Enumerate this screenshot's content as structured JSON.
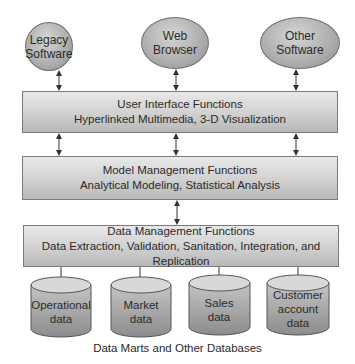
{
  "diagram": {
    "type": "layered-architecture",
    "external_systems": [
      {
        "line1": "Legacy",
        "line2": "Software"
      },
      {
        "line1": "Web",
        "line2": "Browser"
      },
      {
        "line1": "Other",
        "line2": "Software"
      }
    ],
    "layers": [
      {
        "title": "User Interface Functions",
        "subtitle": "Hyperlinked Multimedia, 3-D Visualization"
      },
      {
        "title": "Model Management Functions",
        "subtitle": "Analytical Modeling, Statistical Analysis"
      },
      {
        "title": "Data Management Functions",
        "subtitle": "Data Extraction, Validation, Sanitation, Integration, and Replication"
      }
    ],
    "databases": [
      {
        "lines": [
          "Operational",
          "data"
        ]
      },
      {
        "lines": [
          "Market",
          "data"
        ]
      },
      {
        "lines": [
          "Sales",
          "data"
        ]
      },
      {
        "lines": [
          "Customer",
          "account",
          "data"
        ]
      }
    ],
    "caption": "Data Marts and Other Databases",
    "colors": {
      "shape_fill": "#b0b0b0",
      "box_fill": "#d0d0d0",
      "stroke": "#6e6e6e",
      "text": "#2a2a2a"
    }
  }
}
